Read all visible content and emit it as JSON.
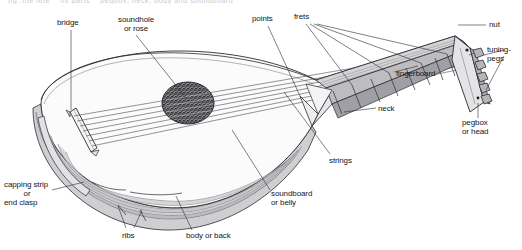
{
  "figure": {
    "partial_top_caption": "fig. the lute    its parts    pegbox, neck, body and soundboard",
    "background_color": "#ffffff",
    "line_color": "#2b2b30",
    "fill_light": "#f3f3f4",
    "fill_rib": "#d8d8da",
    "fill_shadow": "#b9b9bd",
    "rose_color": "#3a3a3e",
    "text_color": "#16161a"
  },
  "labels": [
    {
      "id": "bridge",
      "text": "bridge",
      "lines": [
        "bridge"
      ],
      "x": 57,
      "y": 18,
      "align": "left"
    },
    {
      "id": "soundhole",
      "text": "soundhole or rose",
      "lines": [
        "soundhole",
        "or rose"
      ],
      "x": 113,
      "y": 15,
      "align": "center"
    },
    {
      "id": "points",
      "text": "points",
      "lines": [
        "points"
      ],
      "x": 252,
      "y": 14,
      "align": "left"
    },
    {
      "id": "frets",
      "text": "frets",
      "lines": [
        "frets"
      ],
      "x": 294,
      "y": 12,
      "align": "left"
    },
    {
      "id": "nut",
      "text": "nut",
      "lines": [
        "nut"
      ],
      "x": 489,
      "y": 20,
      "align": "left"
    },
    {
      "id": "tuning-pegs",
      "text": "tuning-pegs",
      "lines": [
        "tuning-",
        "pegs"
      ],
      "x": 487,
      "y": 49,
      "align": "left"
    },
    {
      "id": "fingerboard",
      "text": "fingerboard",
      "lines": [
        "fingerboard"
      ],
      "x": 396,
      "y": 69,
      "align": "left"
    },
    {
      "id": "pegbox",
      "text": "pegbox or head",
      "lines": [
        "pegbox",
        "or head"
      ],
      "x": 462,
      "y": 118,
      "align": "left"
    },
    {
      "id": "neck",
      "text": "neck",
      "lines": [
        "neck"
      ],
      "x": 378,
      "y": 105,
      "align": "left"
    },
    {
      "id": "strings",
      "text": "strings",
      "lines": [
        "strings"
      ],
      "x": 329,
      "y": 157,
      "align": "left"
    },
    {
      "id": "soundboard",
      "text": "soundboard or belly",
      "lines": [
        "soundboard",
        "or belly"
      ],
      "x": 271,
      "y": 189,
      "align": "left"
    },
    {
      "id": "body-or-back",
      "text": "body or back",
      "lines": [
        "body or back"
      ],
      "x": 186,
      "y": 232,
      "align": "left"
    },
    {
      "id": "ribs",
      "text": "ribs",
      "lines": [
        "ribs"
      ],
      "x": 122,
      "y": 231,
      "align": "left"
    },
    {
      "id": "capping-strip",
      "text": "capping strip or end clasp",
      "lines": [
        "capping strip",
        "or",
        "end clasp"
      ],
      "x": 4,
      "y": 182,
      "align": "left"
    }
  ],
  "parts": [
    {
      "name": "bridge",
      "description": "thin elongated bar glued across the soundboard where the strings terminate"
    },
    {
      "name": "soundhole",
      "description": "ornamental pierced rose cut into the soundboard"
    },
    {
      "name": "points",
      "description": "pointed tips where the soundboard meets the neck joint"
    },
    {
      "name": "frets",
      "description": "tied gut frets across the fingerboard"
    },
    {
      "name": "nut",
      "description": "ridge at the top of the fingerboard spacing the strings"
    },
    {
      "name": "tuning-pegs",
      "description": "friction pegs set into the pegbox"
    },
    {
      "name": "fingerboard",
      "description": "flat board over the neck under the strings"
    },
    {
      "name": "pegbox",
      "description": "angled back head holding the tuning pegs"
    },
    {
      "name": "neck",
      "description": "tapering arm joining body to pegbox"
    },
    {
      "name": "strings",
      "description": "courses running from bridge to nut"
    },
    {
      "name": "soundboard",
      "description": "flat front face of the lute body"
    },
    {
      "name": "body",
      "description": "rounded bowl back of the lute"
    },
    {
      "name": "ribs",
      "description": "thin curved staves forming the bowl"
    },
    {
      "name": "capping-strip",
      "description": "strip covering the join at the lower end of the bowl"
    }
  ]
}
